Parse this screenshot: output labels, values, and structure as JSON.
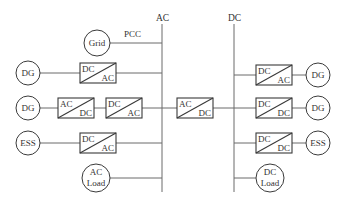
{
  "diagram": {
    "buses": {
      "ac": {
        "label": "AC"
      },
      "dc": {
        "label": "DC"
      }
    },
    "pcc_label": "PCC",
    "ac_side": {
      "grid": {
        "label": "Grid"
      },
      "row1": {
        "source": "DG",
        "converter": {
          "top": "DC",
          "bottom": "AC"
        }
      },
      "row2": {
        "source": "DG",
        "converter1": {
          "top": "AC",
          "bottom": "DC"
        },
        "converter2": {
          "top": "DC",
          "bottom": "AC"
        }
      },
      "row3": {
        "source": "ESS",
        "converter": {
          "top": "DC",
          "bottom": "AC"
        }
      },
      "load": {
        "line1": "AC",
        "line2": "Load"
      }
    },
    "interlink": {
      "converter": {
        "top": "AC",
        "bottom": "DC"
      }
    },
    "dc_side": {
      "row1": {
        "source": "DG",
        "converter": {
          "top": "DC",
          "bottom": "AC"
        }
      },
      "row2": {
        "source": "DG",
        "converter": {
          "top": "DC",
          "bottom": "DC"
        }
      },
      "row3": {
        "source": "ESS",
        "converter": {
          "top": "DC",
          "bottom": "DC"
        }
      },
      "load": {
        "line1": "DC",
        "line2": "Load"
      }
    }
  }
}
